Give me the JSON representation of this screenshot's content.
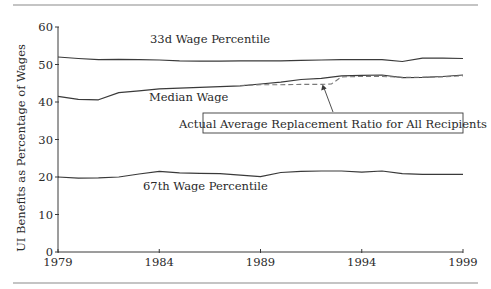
{
  "chart_data": {
    "type": "line",
    "title": "",
    "xlabel": "",
    "ylabel": "UI Benefits as Percentage of Wages",
    "xlim": [
      1979,
      1999
    ],
    "ylim": [
      0,
      60
    ],
    "x_ticks": [
      "1979",
      "1984",
      "1989",
      "1994",
      "1999"
    ],
    "y_ticks": [
      "0",
      "10",
      "20",
      "30",
      "40",
      "50",
      "60"
    ],
    "grid": false,
    "legend": "inline labels",
    "series": [
      {
        "name": "33d Wage Percentile",
        "style": "solid",
        "x": [
          1979,
          1980,
          1981,
          1982,
          1983,
          1984,
          1985,
          1986,
          1987,
          1988,
          1989,
          1990,
          1991,
          1992,
          1993,
          1994,
          1995,
          1996,
          1997,
          1998,
          1999
        ],
        "values": [
          52.0,
          51.6,
          51.3,
          51.4,
          51.3,
          51.2,
          51.0,
          50.9,
          50.9,
          51.0,
          51.0,
          51.0,
          51.1,
          51.2,
          51.3,
          51.3,
          51.3,
          50.8,
          51.7,
          51.7,
          51.6
        ]
      },
      {
        "name": "Median Wage",
        "style": "solid",
        "x": [
          1979,
          1980,
          1981,
          1982,
          1983,
          1984,
          1985,
          1986,
          1987,
          1988,
          1989,
          1990,
          1991,
          1992,
          1993,
          1994,
          1995,
          1996,
          1997,
          1998,
          1999
        ],
        "values": [
          41.5,
          40.7,
          40.6,
          42.5,
          43.0,
          43.5,
          43.7,
          43.9,
          44.1,
          44.3,
          44.8,
          45.3,
          46.0,
          46.3,
          47.0,
          47.1,
          47.2,
          46.5,
          46.6,
          46.8,
          47.2
        ]
      },
      {
        "name": "67th Wage Percentile",
        "style": "solid",
        "x": [
          1979,
          1980,
          1981,
          1982,
          1983,
          1984,
          1985,
          1986,
          1987,
          1988,
          1989,
          1990,
          1991,
          1992,
          1993,
          1994,
          1995,
          1996,
          1997,
          1998,
          1999
        ],
        "values": [
          20.0,
          19.7,
          19.8,
          20.0,
          20.8,
          21.5,
          21.1,
          21.0,
          20.9,
          20.5,
          20.1,
          21.2,
          21.5,
          21.6,
          21.6,
          21.3,
          21.6,
          20.9,
          20.7,
          20.7,
          20.7
        ]
      },
      {
        "name": "Actual Average Replacement Ratio for All Recipients",
        "style": "dashed",
        "x": [
          1988,
          1989,
          1990,
          1991,
          1992,
          1992.5,
          1993,
          1994,
          1995,
          1996,
          1997,
          1998,
          1999
        ],
        "values": [
          44.4,
          44.6,
          44.6,
          44.7,
          44.7,
          44.8,
          46.7,
          46.8,
          46.8,
          46.6,
          46.6,
          46.7,
          47.0
        ]
      }
    ],
    "annotations": [
      {
        "text": "33d Wage Percentile",
        "x": 1987.6,
        "y": 56.5
      },
      {
        "text": "Median Wage",
        "x": 1986.0,
        "y": 41.3
      },
      {
        "text": "67th Wage Percentile",
        "x": 1987.6,
        "y": 17.7
      },
      {
        "text": "Actual Average Replacement Ratio for All Recipients",
        "boxed": true,
        "arrow_to": {
          "x": 1992.2,
          "y": 44.8
        }
      }
    ]
  },
  "labels": {
    "ylabel": "UI Benefits as Percentage of Wages",
    "s33": "33d Wage Percentile",
    "median": "Median Wage",
    "s67": "67th Wage Percentile",
    "actual": "Actual Average Replacement Ratio for All Recipients"
  },
  "ticks": {
    "x": [
      "1979",
      "1984",
      "1989",
      "1994",
      "1999"
    ],
    "y": [
      "0",
      "10",
      "20",
      "30",
      "40",
      "50",
      "60"
    ]
  },
  "colors": {
    "line": "#3a3a3a",
    "dashed": "#7a7a7a",
    "rule": "#8a8a8a"
  }
}
